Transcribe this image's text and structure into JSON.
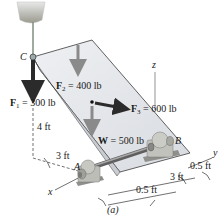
{
  "figure": {
    "caption": "(a)",
    "colors": {
      "plate_fill": "#e4e6ea",
      "plate_edge": "#3a3a3a",
      "arrow_gray": "#8a8a8a",
      "arrow_dark": "#2b2b2b",
      "support": "#b8b8b4",
      "shaft": "#707070"
    }
  },
  "points": {
    "A": "A",
    "B": "B",
    "C": "C"
  },
  "axes": {
    "x": "x",
    "y": "y",
    "z": "z"
  },
  "forces": {
    "F1": {
      "symbol": "F",
      "sub": "1",
      "value": "= 300 lb"
    },
    "F2": {
      "symbol": "F",
      "sub": "2",
      "value": "= 400 lb"
    },
    "F3": {
      "symbol": "F",
      "sub": "3",
      "value": "= 600 lb"
    },
    "W": {
      "symbol": "W",
      "value": "= 500 lb"
    }
  },
  "dimensions": {
    "vertical_4ft": "4 ft",
    "horizontal_3ft_left": "3 ft",
    "horizontal_3ft_right": "3 ft",
    "offset_top": "0.5 ft",
    "offset_bottom": "0.5 ft"
  }
}
